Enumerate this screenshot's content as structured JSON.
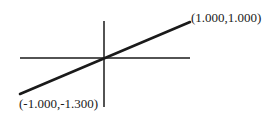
{
  "diagram": {
    "type": "line-segment-on-axes",
    "axes": {
      "horizontal": {
        "x1": 20,
        "y1": 58,
        "x2": 190,
        "y2": 58
      },
      "vertical": {
        "x1": 104,
        "y1": 21,
        "x2": 104,
        "y2": 107
      }
    },
    "segment": {
      "start": {
        "x": 20,
        "y": 94,
        "label": "(-1.000,-1.300)"
      },
      "end": {
        "x": 190,
        "y": 22,
        "label": "(1.000,1.000)"
      }
    },
    "colors": {
      "line": "#1a1a1a",
      "background": "#ffffff"
    }
  }
}
